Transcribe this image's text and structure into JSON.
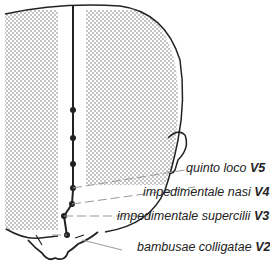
{
  "diagram": {
    "colors": {
      "line": "#222222",
      "stipple": "#777777",
      "leader": "#999999",
      "background": "#ffffff"
    },
    "points": [
      {
        "name": "quinto loco",
        "code": "V5"
      },
      {
        "name": "impedimentale nasi",
        "code": "V4"
      },
      {
        "name": "impedimentale supercilii",
        "code": "V3"
      },
      {
        "name": "bambusae colligatae",
        "code": "V2"
      }
    ]
  }
}
